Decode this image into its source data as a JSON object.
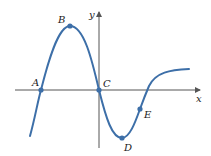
{
  "figure": {
    "type": "function-graph",
    "axes": {
      "x_label": "x",
      "y_label": "y",
      "axis_color": "#555555"
    },
    "curve": {
      "color": "#3d6fa8",
      "description": "Smooth curve rising through A to local max B, descending through origin C to local min D, rising through inflection E, crossing x-axis and leveling off"
    },
    "points": [
      {
        "label": "A",
        "role": "x-intercept",
        "x": 41,
        "y": 90
      },
      {
        "label": "B",
        "role": "local maximum",
        "x": 70,
        "y": 26
      },
      {
        "label": "C",
        "role": "origin",
        "x": 99,
        "y": 90
      },
      {
        "label": "D",
        "role": "local minimum",
        "x": 122,
        "y": 138
      },
      {
        "label": "E",
        "role": "inflection point",
        "x": 140,
        "y": 109
      }
    ]
  }
}
